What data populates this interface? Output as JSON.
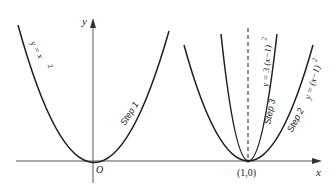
{
  "figure": {
    "colors": {
      "curve": "#1e1e1e",
      "axis": "#555555",
      "dashed": "#444444",
      "text": "#222222",
      "background": "#ffffff"
    },
    "axes": {
      "x_label": "x",
      "y_label": "y",
      "origin_label": "O",
      "shift_point_label": "(1,0)"
    },
    "curves": [
      {
        "id": "base",
        "equation": "y = x²",
        "label_text": "y = x",
        "label_sup": "2",
        "step_label": "Step 1"
      },
      {
        "id": "shifted",
        "equation": "y = (x−1)²",
        "label_text": "y = (x−1)",
        "label_sup": "2",
        "step_label": "Step 2"
      },
      {
        "id": "stretched",
        "equation": "y = 3(x−1)²",
        "label_text": "y = 3 (x−1)",
        "label_sup": "2",
        "step_label": "Step 3"
      }
    ],
    "dashed_line": "x = 1 (axis of symmetry)"
  }
}
